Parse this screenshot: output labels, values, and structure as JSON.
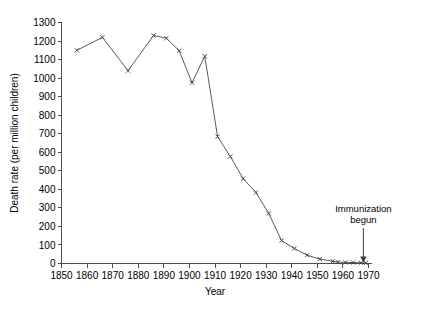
{
  "chart_data": {
    "type": "line",
    "title": "",
    "xlabel": "Year",
    "ylabel": "Death rate (per million children)",
    "xlim": [
      1850,
      1970
    ],
    "ylim": [
      0,
      1300
    ],
    "grid": false,
    "legend": "none",
    "xticks": [
      1850,
      1860,
      1870,
      1880,
      1890,
      1900,
      1910,
      1920,
      1930,
      1940,
      1950,
      1960,
      1970
    ],
    "yticks": [
      0,
      100,
      200,
      300,
      400,
      500,
      600,
      700,
      800,
      900,
      1000,
      1100,
      1200,
      1300
    ],
    "marker": "x",
    "series": [
      {
        "name": "Measles death rate",
        "x": [
          1856,
          1866,
          1876,
          1886,
          1891,
          1896,
          1901,
          1906,
          1911,
          1916,
          1921,
          1926,
          1931,
          1936,
          1941,
          1946,
          1951,
          1956,
          1958,
          1961,
          1964,
          1967,
          1969
        ],
        "values": [
          1150,
          1220,
          1040,
          1230,
          1215,
          1148,
          975,
          1118,
          685,
          577,
          458,
          383,
          270,
          124,
          81,
          45,
          24,
          12,
          8,
          6,
          5,
          4,
          3
        ]
      }
    ],
    "annotations": [
      {
        "name": "immunization-begun",
        "text_line1": "Immunization",
        "text_line2": "begun",
        "x": 1968,
        "y": 0
      }
    ]
  },
  "axis": {
    "x_title": "Year",
    "y_title": "Death rate (per million children)",
    "x_labels": [
      "1850",
      "1860",
      "1870",
      "1880",
      "1890",
      "1900",
      "1910",
      "1920",
      "1930",
      "1940",
      "1950",
      "1960",
      "1970"
    ],
    "y_labels": [
      "0",
      "100",
      "200",
      "300",
      "400",
      "500",
      "600",
      "700",
      "800",
      "900",
      "1000",
      "1100",
      "1200",
      "1300"
    ]
  },
  "annotation": {
    "line1": "Immunization",
    "line2": "begun"
  },
  "colors": {
    "line": "#5a5a5a",
    "axis": "#4d4d4d",
    "text": "#000000",
    "background": "#ffffff"
  }
}
